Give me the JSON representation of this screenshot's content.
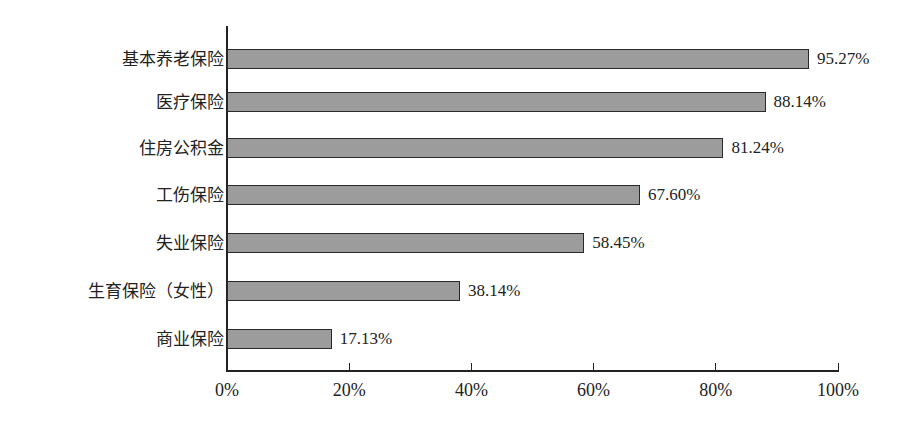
{
  "chart_data": {
    "type": "bar",
    "orientation": "horizontal",
    "title": "",
    "xlabel": "",
    "ylabel": "",
    "xlim": [
      0,
      100
    ],
    "grid": false,
    "legend": null,
    "categories": [
      "基本养老保险",
      "医疗保险",
      "住房公积金",
      "工伤保险",
      "失业保险",
      "生育保险（女性）",
      "商业保险"
    ],
    "values": [
      95.27,
      88.14,
      81.24,
      67.6,
      58.45,
      38.14,
      17.13
    ],
    "value_labels": [
      "95.27%",
      "88.14%",
      "81.24%",
      "67.60%",
      "58.45%",
      "38.14%",
      "17.13%"
    ],
    "x_ticks": [
      0,
      20,
      40,
      60,
      80,
      100
    ],
    "x_tick_labels": [
      "0%",
      "20%",
      "40%",
      "60%",
      "80%",
      "100%"
    ],
    "colors": {
      "bar_fill": "#9c9c9c",
      "bar_edge": "#2a2a2a",
      "axis": "#222222"
    }
  }
}
